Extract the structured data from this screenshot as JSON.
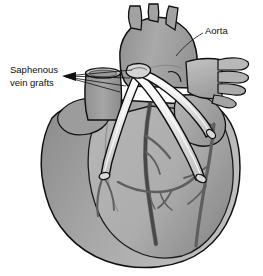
{
  "figure": {
    "type": "medical-illustration",
    "view": "anterior",
    "background_color": "#ffffff",
    "width": 263,
    "height": 276
  },
  "labels": {
    "aorta": {
      "text": "Aorta",
      "x": 205,
      "y": 31,
      "anchor": "start",
      "leader_to": "aortic-arch"
    },
    "saphenous_line1": {
      "text": "Saphenous",
      "x": 10,
      "y": 70,
      "anchor": "start"
    },
    "saphenous_line2": {
      "text": "vein grafts",
      "x": 10,
      "y": 83,
      "anchor": "start",
      "leader_to": "graft-origins"
    }
  },
  "anatomy": {
    "aortic_arch": {
      "name": "Aorta",
      "branches": [
        "brachiocephalic trunk",
        "left common carotid artery",
        "left subclavian artery"
      ],
      "branch_count": 3,
      "fill": "#a0a0a0"
    },
    "superior_vena_cava": {
      "name": "Superior vena cava (cut)",
      "cut_open": true,
      "fill": "#9a9a9a"
    },
    "pulmonary_veins": {
      "name": "Pulmonary veins",
      "finger_count": 4,
      "fill": "#b4b4b4"
    },
    "right_atrium": {
      "name": "Right atrium",
      "fill": "#b0b0b0"
    },
    "left_ventricle": {
      "name": "Left ventricle",
      "fill": "#999999"
    },
    "right_ventricle": {
      "name": "Right ventricle",
      "fill": "#a8a8a8"
    },
    "coronary_arteries": {
      "name": "Coronary arteries",
      "fill": "#6d6d6d"
    }
  },
  "grafts": {
    "count": 3,
    "vessel_name": "Saphenous vein graft",
    "fill": "#e8e8e8",
    "stroke": "#1a1a1a",
    "items": [
      {
        "id": "graft-left",
        "target": "Left anterior descending / diagonal branch",
        "anastomosis_x": 103,
        "anastomosis_y": 174
      },
      {
        "id": "graft-mid",
        "target": "Obtuse marginal branch",
        "anastomosis_x": 203,
        "anastomosis_y": 178
      },
      {
        "id": "graft-right",
        "target": "Right coronary artery",
        "anastomosis_x": 213,
        "anastomosis_y": 133
      }
    ],
    "origin": {
      "x": 136,
      "y": 73,
      "description": "Proximal anastomoses on ascending aorta"
    }
  },
  "colors": {
    "outline": "#101010",
    "text": "#101010",
    "leader_line": "#1a1a1a",
    "heart_light": "#bcbcbc",
    "heart_mid": "#a8a8a8",
    "heart_dark": "#8f8f8f",
    "graft_fill": "#ececec",
    "vessel_dark": "#6b6b6b"
  }
}
